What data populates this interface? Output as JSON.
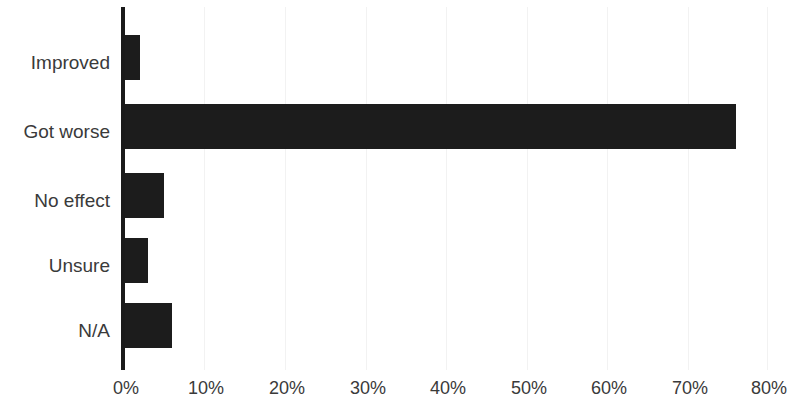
{
  "chart_data": {
    "type": "bar",
    "orientation": "horizontal",
    "title": "",
    "subtitle": "",
    "xlabel": "",
    "ylabel": "",
    "categories": [
      "Improved",
      "Got worse",
      "No effect",
      "Unsure",
      "N/A"
    ],
    "values": [
      2,
      76,
      5,
      3,
      6
    ],
    "value_suffix": "%",
    "xlim": [
      0,
      80
    ],
    "xtick_values": [
      0,
      10,
      20,
      30,
      40,
      50,
      60,
      70,
      80
    ],
    "xtick_labels": [
      "0%",
      "10%",
      "20%",
      "30%",
      "40%",
      "50%",
      "60%",
      "70%",
      "80%"
    ],
    "grid": true,
    "grid_axis": "x",
    "legend": false,
    "legend_position": "none",
    "series": [
      {
        "name": "",
        "values": [
          2,
          76,
          5,
          3,
          6
        ]
      }
    ]
  },
  "style": {
    "bar_color": "#1c1c1c",
    "axis_color": "#1a1a1a",
    "grid_color": "#f2f2f2",
    "text_color": "#3a3a3a",
    "background": "#ffffff"
  }
}
